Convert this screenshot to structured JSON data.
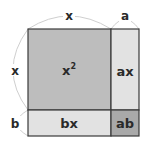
{
  "diagram": {
    "title": "",
    "colors": {
      "x_squared": "#bdbdbd",
      "ax": "#e2e2e2",
      "bx": "#e2e2e2",
      "ab": "#a9a9a9",
      "border": "#3a3a3a",
      "arc": "#c8c8c8",
      "text": "#2a2a2a"
    },
    "regions": {
      "x_squared": {
        "label": "x",
        "superscript": "2"
      },
      "ax": {
        "label": "ax"
      },
      "bx": {
        "label": "bx"
      },
      "ab": {
        "label": "ab"
      }
    },
    "dimensions": {
      "top_x": "x",
      "top_a": "a",
      "left_x": "x",
      "left_b": "b"
    }
  }
}
